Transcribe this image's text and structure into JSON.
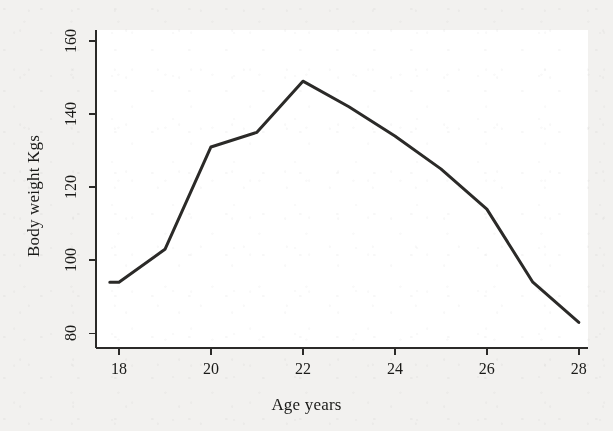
{
  "figure": {
    "background_color": "#f2f1ef",
    "plot_background_color": "#ffffff",
    "ink_color": "#2b2a28"
  },
  "chart_data": {
    "type": "line",
    "title": "",
    "subtitle": "",
    "xlabel": "Age years",
    "ylabel": "Body weight Kgs",
    "xlim": [
      17.5,
      28.2
    ],
    "ylim": [
      76,
      163
    ],
    "xticks": [
      18,
      20,
      22,
      24,
      26,
      28
    ],
    "xtick_labels": [
      "18",
      "20",
      "22",
      "24",
      "26",
      "28"
    ],
    "yticks": [
      80,
      100,
      120,
      140,
      160
    ],
    "ytick_labels": [
      "80",
      "100",
      "120",
      "140",
      "160"
    ],
    "grid": false,
    "legend": null,
    "legend_position": "none",
    "annotations": [],
    "series": [
      {
        "name": "Body weight",
        "color": "#2b2a28",
        "line_width": 3,
        "marker": "none",
        "x": [
          17.8,
          18.0,
          19.0,
          20.0,
          21.0,
          22.0,
          23.0,
          24.0,
          25.0,
          26.0,
          27.0,
          28.0
        ],
        "values": [
          94,
          94,
          103,
          131,
          135,
          149,
          142,
          134,
          125,
          114,
          94,
          83
        ]
      }
    ]
  }
}
